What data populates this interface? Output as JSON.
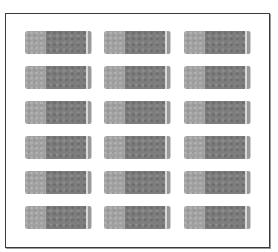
{
  "frame": {
    "border_color": "#3a3a3a",
    "background": "#ffffff"
  },
  "grid": {
    "rows": 6,
    "columns": 3,
    "blocks": [
      {
        "row": 1,
        "col": 1
      },
      {
        "row": 1,
        "col": 2
      },
      {
        "row": 1,
        "col": 3
      },
      {
        "row": 2,
        "col": 1
      },
      {
        "row": 2,
        "col": 2
      },
      {
        "row": 2,
        "col": 3
      },
      {
        "row": 3,
        "col": 1
      },
      {
        "row": 3,
        "col": 2
      },
      {
        "row": 3,
        "col": 3
      },
      {
        "row": 4,
        "col": 1
      },
      {
        "row": 4,
        "col": 2
      },
      {
        "row": 4,
        "col": 3
      },
      {
        "row": 5,
        "col": 1
      },
      {
        "row": 5,
        "col": 2
      },
      {
        "row": 5,
        "col": 3
      },
      {
        "row": 6,
        "col": 1
      },
      {
        "row": 6,
        "col": 2
      },
      {
        "row": 6,
        "col": 3
      }
    ],
    "colors": {
      "light_segment": "#a0a0a0",
      "dark_segment": "#7d7d7d",
      "highlight_stripe": "#d8d8d8",
      "mid_stripe": "#9a9a9a"
    }
  }
}
